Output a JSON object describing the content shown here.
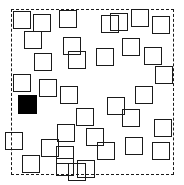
{
  "scene": {
    "title": "Visual search array",
    "width": 184,
    "height": 185,
    "background_color": "#ffffff",
    "stroke_color": "#1a1a1a",
    "target_fill_color": "#000000",
    "distractor_count": 35,
    "target_count": 1
  },
  "frame": {
    "label": "dashed-boundary",
    "x": 11,
    "y": 9,
    "width": 163,
    "height": 166,
    "border_width": 1.4,
    "dash": "7 5",
    "color": "#1a1a1a"
  },
  "items": [
    {
      "id": "sq-01",
      "kind": "outline",
      "x": 13,
      "y": 11,
      "size": 18,
      "stroke": 1.6
    },
    {
      "id": "sq-02",
      "kind": "outline",
      "x": 33,
      "y": 14,
      "size": 18,
      "stroke": 1.6
    },
    {
      "id": "sq-03",
      "kind": "outline",
      "x": 59,
      "y": 10,
      "size": 18,
      "stroke": 1.6
    },
    {
      "id": "sq-04",
      "kind": "outline",
      "x": 110,
      "y": 13,
      "size": 18,
      "stroke": 1.6
    },
    {
      "id": "sq-05",
      "kind": "outline",
      "x": 131,
      "y": 9,
      "size": 18,
      "stroke": 1.6
    },
    {
      "id": "sq-06",
      "kind": "outline",
      "x": 152,
      "y": 16,
      "size": 18,
      "stroke": 1.6
    },
    {
      "id": "sq-07",
      "kind": "outline",
      "x": 24,
      "y": 31,
      "size": 18,
      "stroke": 1.6
    },
    {
      "id": "sq-08",
      "kind": "outline",
      "x": 63,
      "y": 37,
      "size": 18,
      "stroke": 1.6
    },
    {
      "id": "sq-09",
      "kind": "outline",
      "x": 122,
      "y": 38,
      "size": 18,
      "stroke": 1.6
    },
    {
      "id": "sq-10",
      "kind": "outline",
      "x": 34,
      "y": 53,
      "size": 18,
      "stroke": 1.6
    },
    {
      "id": "sq-11",
      "kind": "outline",
      "x": 68,
      "y": 51,
      "size": 18,
      "stroke": 1.6
    },
    {
      "id": "sq-12",
      "kind": "outline",
      "x": 96,
      "y": 48,
      "size": 18,
      "stroke": 1.6
    },
    {
      "id": "sq-13",
      "kind": "outline",
      "x": 144,
      "y": 47,
      "size": 18,
      "stroke": 1.6
    },
    {
      "id": "sq-14",
      "kind": "outline",
      "x": 13,
      "y": 74,
      "size": 18,
      "stroke": 1.6
    },
    {
      "id": "sq-15",
      "kind": "outline",
      "x": 39,
      "y": 79,
      "size": 18,
      "stroke": 1.6
    },
    {
      "id": "sq-16",
      "kind": "outline",
      "x": 60,
      "y": 86,
      "size": 18,
      "stroke": 1.6
    },
    {
      "id": "sq-17",
      "kind": "target",
      "x": 18,
      "y": 95,
      "size": 19,
      "stroke": 1.6
    },
    {
      "id": "sq-18",
      "kind": "outline",
      "x": 135,
      "y": 86,
      "size": 18,
      "stroke": 1.6
    },
    {
      "id": "sq-19",
      "kind": "outline",
      "x": 107,
      "y": 97,
      "size": 18,
      "stroke": 1.6
    },
    {
      "id": "sq-20",
      "kind": "outline",
      "x": 122,
      "y": 109,
      "size": 18,
      "stroke": 1.6
    },
    {
      "id": "sq-21",
      "kind": "outline",
      "x": 76,
      "y": 108,
      "size": 18,
      "stroke": 1.6
    },
    {
      "id": "sq-22",
      "kind": "outline",
      "x": 154,
      "y": 119,
      "size": 18,
      "stroke": 1.6
    },
    {
      "id": "sq-23",
      "kind": "outline",
      "x": 57,
      "y": 124,
      "size": 18,
      "stroke": 1.6
    },
    {
      "id": "sq-24",
      "kind": "outline",
      "x": 86,
      "y": 128,
      "size": 18,
      "stroke": 1.6
    },
    {
      "id": "sq-25",
      "kind": "outline",
      "x": 125,
      "y": 137,
      "size": 18,
      "stroke": 1.6
    },
    {
      "id": "sq-26",
      "kind": "outline",
      "x": 152,
      "y": 142,
      "size": 18,
      "stroke": 1.6
    },
    {
      "id": "sq-27",
      "kind": "outline",
      "x": 41,
      "y": 139,
      "size": 18,
      "stroke": 1.6
    },
    {
      "id": "sq-28",
      "kind": "outline",
      "x": 56,
      "y": 146,
      "size": 18,
      "stroke": 1.6
    },
    {
      "id": "sq-29",
      "kind": "outline",
      "x": 22,
      "y": 155,
      "size": 18,
      "stroke": 1.6
    },
    {
      "id": "sq-30",
      "kind": "outline",
      "x": 56,
      "y": 158,
      "size": 18,
      "stroke": 1.6
    },
    {
      "id": "sq-31",
      "kind": "outline",
      "x": 77,
      "y": 160,
      "size": 18,
      "stroke": 1.6
    },
    {
      "id": "sq-32",
      "kind": "outline",
      "x": 101,
      "y": 15,
      "size": 18,
      "stroke": 1.6
    },
    {
      "id": "sq-33",
      "kind": "outline",
      "x": 155,
      "y": 66,
      "size": 18,
      "stroke": 1.6
    },
    {
      "id": "sq-34",
      "kind": "outline",
      "x": 97,
      "y": 142,
      "size": 18,
      "stroke": 1.6
    },
    {
      "id": "sq-35",
      "kind": "outline",
      "x": 68,
      "y": 163,
      "size": 18,
      "stroke": 1.6
    },
    {
      "id": "sq-36",
      "kind": "outline",
      "x": 5,
      "y": 132,
      "size": 18,
      "stroke": 1.6
    }
  ]
}
